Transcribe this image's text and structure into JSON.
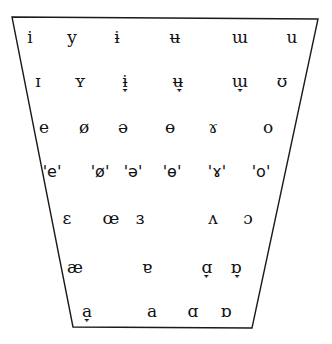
{
  "diagram": {
    "type": "vowel-quadrilateral",
    "outline": {
      "stroke": "#1a1a1a",
      "points": [
        [
          12,
          17
        ],
        [
          318,
          19
        ],
        [
          252,
          328
        ],
        [
          73,
          327
        ]
      ]
    },
    "rows": [
      {
        "y": 37,
        "symbols": [
          {
            "glyph": "i",
            "x": 30
          },
          {
            "glyph": "y",
            "x": 72
          },
          {
            "glyph": "ɨ",
            "x": 117
          },
          {
            "glyph": "ʉ",
            "x": 175
          },
          {
            "glyph": "ɯ",
            "x": 240
          },
          {
            "glyph": "u",
            "x": 292
          }
        ]
      },
      {
        "y": 81,
        "symbols": [
          {
            "glyph": "ɪ",
            "x": 38
          },
          {
            "glyph": "ʏ",
            "x": 80
          },
          {
            "glyph": "ɨ̞",
            "x": 125
          },
          {
            "glyph": "ʉ̞",
            "x": 178
          },
          {
            "glyph": "ɯ̞",
            "x": 240
          },
          {
            "glyph": "ʊ",
            "x": 282
          }
        ]
      },
      {
        "y": 127,
        "symbols": [
          {
            "glyph": "e",
            "x": 44
          },
          {
            "glyph": "ø",
            "x": 84
          },
          {
            "glyph": "ə",
            "x": 123
          },
          {
            "glyph": "ɵ",
            "x": 170
          },
          {
            "glyph": "ɤ",
            "x": 213
          },
          {
            "glyph": "o",
            "x": 268
          }
        ]
      },
      {
        "y": 172,
        "quoted": true,
        "symbols": [
          {
            "glyph": "'e'",
            "x": 52
          },
          {
            "glyph": "'ø'",
            "x": 100
          },
          {
            "glyph": "'ə'",
            "x": 133
          },
          {
            "glyph": "'ɵ'",
            "x": 172
          },
          {
            "glyph": "'ɤ'",
            "x": 217
          },
          {
            "glyph": "'o'",
            "x": 261
          }
        ]
      },
      {
        "y": 218,
        "symbols": [
          {
            "glyph": "ɛ",
            "x": 67
          },
          {
            "glyph": "œ",
            "x": 111
          },
          {
            "glyph": "ɜ",
            "x": 140
          },
          {
            "glyph": "ʌ",
            "x": 213
          },
          {
            "glyph": "ɔ",
            "x": 248
          }
        ]
      },
      {
        "y": 267,
        "symbols": [
          {
            "glyph": "æ",
            "x": 75
          },
          {
            "glyph": "ɐ",
            "x": 147
          },
          {
            "glyph": "ɑ̞",
            "x": 207
          },
          {
            "glyph": "ɒ̞",
            "x": 236
          }
        ]
      },
      {
        "y": 311,
        "symbols": [
          {
            "glyph": "a̞",
            "x": 87
          },
          {
            "glyph": "a",
            "x": 152
          },
          {
            "glyph": "ɑ",
            "x": 193
          },
          {
            "glyph": "ɒ",
            "x": 226
          }
        ]
      }
    ]
  }
}
